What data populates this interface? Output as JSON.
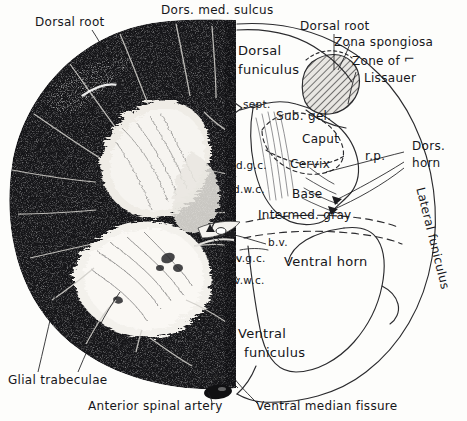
{
  "figure": {
    "width": 467,
    "height": 421,
    "background_color": "#fdfdfb",
    "ink_color": "#16161a",
    "tissue_dark_color": "#17171a",
    "gray_matter_color": "#f2f0ec",
    "hatch_color": "#4a4a4a",
    "left_panel": "photomicrograph half (stained transverse section)",
    "right_panel": "line-drawing schematic half"
  },
  "labels": {
    "dorsal_root_left": "Dorsal root",
    "dors_med_sulcus": "Dors. med. sulcus",
    "dorsal_root_right": "Dorsal root",
    "zona_spongiosa": "Zona spongiosa",
    "zone_of": "Zone of",
    "lissauer": "Lissauer",
    "dorsal_funiculus_1": "Dorsal",
    "dorsal_funiculus_2": "funiculus",
    "sept": "sept.",
    "sub_gel": "Sub. gel.",
    "caput": "Caput",
    "cervix": "Cervix",
    "base": "Base",
    "rp": "r.p.",
    "dgc": "d.g.c.",
    "dwc": "d.w.c.",
    "intermed_gray": "Intermed. gray",
    "bv": "b.v.",
    "vgc": "v.g.c.",
    "vwc": "v.w.c.",
    "ventral_horn": "Ventral horn",
    "dors_horn_1": "Dors.",
    "dors_horn_2": "horn",
    "lateral_funiculus": "Lateral funiculus",
    "ventral_funiculus_1": "Ventral",
    "ventral_funiculus_2": "funiculus",
    "glial_trabeculae": "Glial trabeculae",
    "anterior_spinal_artery": "Anterior spinal artery",
    "ventral_median_fissure": "Ventral median fissure"
  },
  "structures": [
    {
      "key": "dorsal_root_left",
      "label": "Dorsal root",
      "side": "left",
      "kind": "leader-label"
    },
    {
      "key": "dors_med_sulcus",
      "label": "Dors. med. sulcus",
      "side": "center",
      "kind": "leader-label"
    },
    {
      "key": "dorsal_root_right",
      "label": "Dorsal root",
      "side": "right",
      "kind": "leader-label"
    },
    {
      "key": "zona_spongiosa",
      "label": "Zona spongiosa",
      "side": "right",
      "kind": "leader-label"
    },
    {
      "key": "zone_of_lissauer",
      "label": "Zone of Lissauer",
      "side": "right",
      "kind": "leader-label"
    },
    {
      "key": "dorsal_funiculus",
      "label": "Dorsal funiculus",
      "side": "right",
      "kind": "region-label"
    },
    {
      "key": "sept",
      "label": "sept.",
      "side": "right",
      "kind": "leader-label"
    },
    {
      "key": "sub_gel",
      "label": "Sub. gel.",
      "side": "right",
      "kind": "region-label"
    },
    {
      "key": "caput",
      "label": "Caput",
      "side": "right",
      "kind": "region-label"
    },
    {
      "key": "cervix",
      "label": "Cervix",
      "side": "right",
      "kind": "region-label"
    },
    {
      "key": "base",
      "label": "Base",
      "side": "right",
      "kind": "region-label"
    },
    {
      "key": "rp",
      "label": "r.p.",
      "side": "right",
      "kind": "leader-label"
    },
    {
      "key": "dgc",
      "label": "d.g.c.",
      "side": "center",
      "kind": "leader-label"
    },
    {
      "key": "dwc",
      "label": "d.w.c.",
      "side": "center",
      "kind": "leader-label"
    },
    {
      "key": "intermed_gray",
      "label": "Intermed. gray",
      "side": "right",
      "kind": "region-label"
    },
    {
      "key": "bv",
      "label": "b.v.",
      "side": "right",
      "kind": "leader-label"
    },
    {
      "key": "vgc",
      "label": "v.g.c.",
      "side": "center",
      "kind": "leader-label"
    },
    {
      "key": "vwc",
      "label": "v.w.c.",
      "side": "center",
      "kind": "leader-label"
    },
    {
      "key": "ventral_horn",
      "label": "Ventral horn",
      "side": "right",
      "kind": "region-label"
    },
    {
      "key": "dors_horn",
      "label": "Dors. horn",
      "side": "right",
      "kind": "leader-label"
    },
    {
      "key": "lateral_funiculus",
      "label": "Lateral funiculus",
      "side": "right",
      "kind": "curved-label"
    },
    {
      "key": "ventral_funiculus",
      "label": "Ventral funiculus",
      "side": "right",
      "kind": "region-label"
    },
    {
      "key": "glial_trabeculae",
      "label": "Glial trabeculae",
      "side": "left",
      "kind": "leader-label"
    },
    {
      "key": "anterior_spinal_artery",
      "label": "Anterior spinal artery",
      "side": "center",
      "kind": "leader-label"
    },
    {
      "key": "ventral_median_fissure",
      "label": "Ventral median fissure",
      "side": "center",
      "kind": "leader-label"
    }
  ]
}
